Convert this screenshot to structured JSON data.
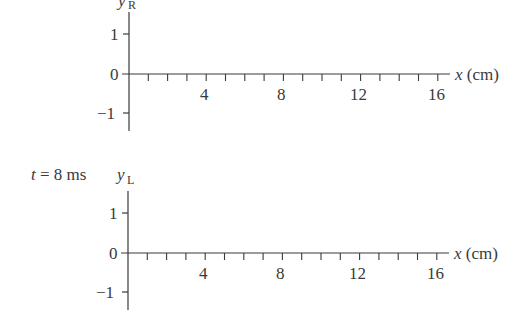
{
  "diagram": {
    "panels": [
      {
        "id": "top",
        "time_label": "",
        "y_axis_label": "y",
        "y_axis_subscript": "R",
        "x_axis_label": "x (cm)",
        "y_ticks": [
          "1",
          "0",
          "−1"
        ],
        "x_tick_labels": [
          "4",
          "8",
          "12",
          "16"
        ]
      },
      {
        "id": "bottom",
        "time_label": "t = 8 ms",
        "y_axis_label": "y",
        "y_axis_subscript": "L",
        "x_axis_label": "x (cm)",
        "y_ticks": [
          "1",
          "0",
          "−1"
        ],
        "x_tick_labels": [
          "4",
          "8",
          "12",
          "16"
        ]
      }
    ]
  },
  "chart_data": [
    {
      "type": "line",
      "title": "",
      "xlabel": "x (cm)",
      "ylabel": "y_R",
      "xlim": [
        0,
        16
      ],
      "ylim": [
        -1,
        1
      ],
      "x_ticks": [
        4,
        8,
        12,
        16
      ],
      "x_minor_tick_step": 1,
      "y_ticks": [
        -1,
        0,
        1
      ],
      "series": [],
      "grid": false
    },
    {
      "type": "line",
      "title": "t = 8 ms",
      "xlabel": "x (cm)",
      "ylabel": "y_L",
      "xlim": [
        0,
        16
      ],
      "ylim": [
        -1,
        1
      ],
      "x_ticks": [
        4,
        8,
        12,
        16
      ],
      "x_minor_tick_step": 1,
      "y_ticks": [
        -1,
        0,
        1
      ],
      "series": [],
      "grid": false
    }
  ]
}
